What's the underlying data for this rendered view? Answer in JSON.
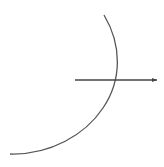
{
  "diagram": {
    "background": "#ffffff",
    "stroke_color": "#444444",
    "arc": {
      "start": [
        104,
        15
      ],
      "control": [
        135,
        55
      ],
      "end": [
        10,
        154
      ],
      "description": "curved arc bulging right"
    },
    "arrow": {
      "from": [
        75,
        80
      ],
      "to": [
        157,
        80
      ],
      "head": "arrowhead at right end"
    }
  }
}
